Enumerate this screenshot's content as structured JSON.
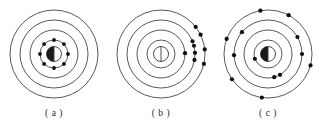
{
  "figure": {
    "background_color": "#ffffff",
    "stroke_color": "#3a3a3a",
    "electron_color": "#101010",
    "nucleus_fill": "#1a1a1a",
    "panel_count": 3
  },
  "panels": [
    {
      "id": "a",
      "caption": "( a )",
      "name": "ground-state-atom",
      "center": {
        "x": 54,
        "y": 54
      },
      "shells": [
        {
          "index": 1,
          "r": 14
        },
        {
          "index": 2,
          "r": 24
        },
        {
          "index": 3,
          "r": 34
        },
        {
          "index": 4,
          "r": 44
        }
      ],
      "nucleus": {
        "r": 7.5,
        "shaded_half": "left",
        "divider": "vertical"
      },
      "electron_count": 8,
      "electron_radius": 1.9,
      "electron_shell_distribution": "all 8 electrons on innermost shell",
      "electrons": [
        {
          "shell": 1,
          "angle_deg": 90
        },
        {
          "shell": 1,
          "angle_deg": 45
        },
        {
          "shell": 1,
          "angle_deg": 0
        },
        {
          "shell": 1,
          "angle_deg": 315
        },
        {
          "shell": 1,
          "angle_deg": 270
        },
        {
          "shell": 1,
          "angle_deg": 225
        },
        {
          "shell": 1,
          "angle_deg": 180
        },
        {
          "shell": 1,
          "angle_deg": 135
        }
      ]
    },
    {
      "id": "b",
      "caption": "( b )",
      "name": "excited-atom-clustered-electrons",
      "center": {
        "x": 54,
        "y": 54
      },
      "shells": [
        {
          "index": 1,
          "r": 14
        },
        {
          "index": 2,
          "r": 24
        },
        {
          "index": 3,
          "r": 34
        },
        {
          "index": 4,
          "r": 44
        }
      ],
      "nucleus": {
        "r": 7.5,
        "shaded_half": "none",
        "divider": "vertical"
      },
      "electron_count": 9,
      "electron_radius": 2.1,
      "electron_shell_distribution": "electrons displaced to right side of outer shells",
      "electrons": [
        {
          "shell": 2,
          "angle_deg": 2
        },
        {
          "shell": 3,
          "angle_deg": 14
        },
        {
          "shell": 3,
          "angle_deg": 22
        },
        {
          "shell": 3,
          "angle_deg": 2
        },
        {
          "shell": 3,
          "angle_deg": 350
        },
        {
          "shell": 4,
          "angle_deg": 38
        },
        {
          "shell": 4,
          "angle_deg": 26
        },
        {
          "shell": 4,
          "angle_deg": 6
        },
        {
          "shell": 4,
          "angle_deg": 347
        }
      ]
    },
    {
      "id": "c",
      "caption": "( c )",
      "name": "excited-atom-distributed-electrons",
      "center": {
        "x": 54,
        "y": 54
      },
      "shells": [
        {
          "index": 1,
          "r": 14
        },
        {
          "index": 2,
          "r": 24
        },
        {
          "index": 3,
          "r": 34
        },
        {
          "index": 4,
          "r": 44
        }
      ],
      "nucleus": {
        "r": 7.5,
        "shaded_half": "left",
        "divider": "vertical"
      },
      "electron_count": 13,
      "electron_radius": 2.1,
      "electron_shell_distribution": "electrons spread around all outer shells",
      "electrons": [
        {
          "shell": 1,
          "angle_deg": 200
        },
        {
          "shell": 2,
          "angle_deg": 300
        },
        {
          "shell": 2,
          "angle_deg": 285
        },
        {
          "shell": 3,
          "angle_deg": 30
        },
        {
          "shell": 3,
          "angle_deg": 0
        },
        {
          "shell": 3,
          "angle_deg": 182
        },
        {
          "shell": 3,
          "angle_deg": 140
        },
        {
          "shell": 4,
          "angle_deg": 62
        },
        {
          "shell": 4,
          "angle_deg": 100
        },
        {
          "shell": 4,
          "angle_deg": 160
        },
        {
          "shell": 4,
          "angle_deg": 215
        },
        {
          "shell": 4,
          "angle_deg": 262
        },
        {
          "shell": 4,
          "angle_deg": 345
        }
      ]
    }
  ]
}
